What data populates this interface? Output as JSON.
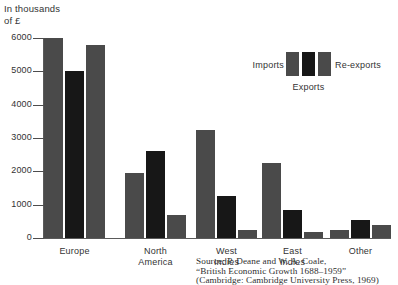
{
  "chart_data": {
    "type": "bar",
    "title": "",
    "subtitle": "",
    "ylabel": "In thousands\nof £",
    "xlabel": "",
    "ylim": [
      0,
      6000
    ],
    "ytick_labels": [
      "6000",
      "5000",
      "4000",
      "3000",
      "2000",
      "1000",
      "0"
    ],
    "ytick_values": [
      6000,
      5000,
      4000,
      3000,
      2000,
      1000,
      0
    ],
    "grid": false,
    "legend_position": "upper-right",
    "categories": [
      "Europe",
      "North\nAmerica",
      "West\nIndies",
      "East\nIndies",
      "Other"
    ],
    "series": [
      {
        "name": "Imports",
        "color": "#4a4a4a",
        "values": [
          6000,
          1950,
          3250,
          2250,
          230
        ]
      },
      {
        "name": "Exports",
        "color": "#171717",
        "values": [
          5000,
          2620,
          1250,
          850,
          550
        ]
      },
      {
        "name": "Re-exports",
        "color": "#4a4a4a",
        "values": [
          5800,
          680,
          250,
          180,
          380
        ]
      }
    ],
    "source_note": "Source: P. Deane and W. A. Coale,\n“British Economic Growth 1688–1959”\n(Cambridge: Cambridge University Press, 1969)"
  },
  "legend": {
    "imports_label": "Imports",
    "exports_label": "Exports",
    "reexports_label": "Re-exports"
  }
}
